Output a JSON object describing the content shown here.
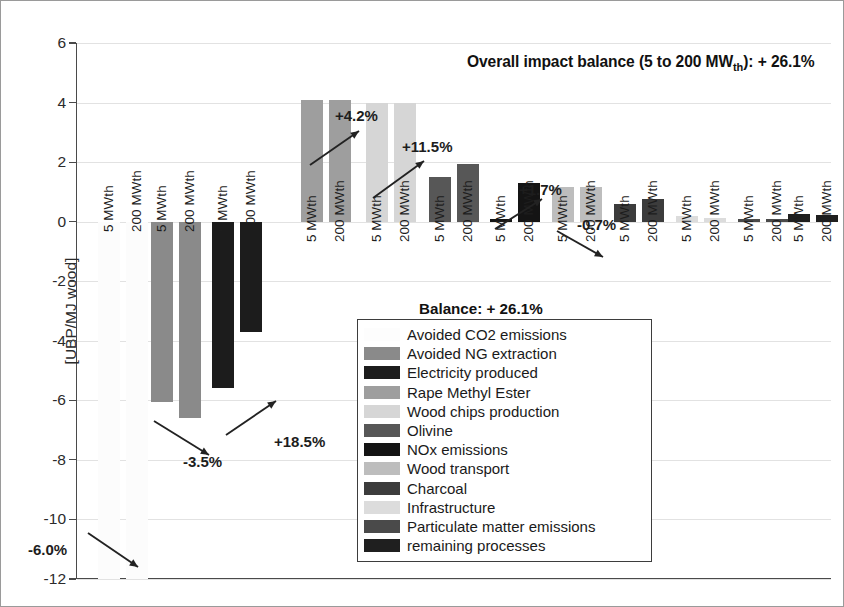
{
  "title": {
    "prefix": "Overall impact balance (5 to 200 MW",
    "sub": "th",
    "suffix": "): + 26.1%",
    "full": "Overall impact balance (5 to 200 MWth): + 26.1%"
  },
  "balance_label": "Balance: + 26.1%",
  "axis": {
    "ylabel": "[UBP/MJ wood]",
    "yticks": [
      "6",
      "4",
      "2",
      "0",
      "-2",
      "-4",
      "-6",
      "-8",
      "-10",
      "-12"
    ],
    "ymin": -12,
    "ymax": 6,
    "step": 2
  },
  "bar_labels": {
    "small": "5 MWth",
    "large": "200 MWth"
  },
  "legend": {
    "items": [
      {
        "label": "Avoided CO2 emissions",
        "color": "#fbfbfb"
      },
      {
        "label": "Avoided NG extraction",
        "color": "#8a8a8a"
      },
      {
        "label": "Electricity produced",
        "color": "#1c1c1c"
      },
      {
        "label": "Rape Methyl Ester",
        "color": "#9e9e9e"
      },
      {
        "label": "Wood chips production",
        "color": "#d6d6d6"
      },
      {
        "label": "Olivine",
        "color": "#575757"
      },
      {
        "label": "NOx emissions",
        "color": "#141414"
      },
      {
        "label": "Wood transport",
        "color": "#bdbdbd"
      },
      {
        "label": "Charcoal",
        "color": "#3c3c3c"
      },
      {
        "label": "Infrastructure",
        "color": "#dcdcdc"
      },
      {
        "label": "Particulate matter emissions",
        "color": "#4a4a4a"
      },
      {
        "label": "remaining processes",
        "color": "#1f1f1f"
      }
    ]
  },
  "chart_data": {
    "type": "bar",
    "title": "Overall impact balance (5 to 200 MWth): + 26.1%",
    "xlabel": "",
    "ylabel": "[UBP/MJ wood]",
    "ylim": [
      -12,
      6
    ],
    "ytick_step": 2,
    "grid": true,
    "legend_position": "inside-bottom-center",
    "series": [
      {
        "name": "5 MWth",
        "values": [
          -12.6,
          -6.05,
          -5.6,
          4.1,
          4.0,
          1.5,
          0.1,
          1.15,
          0.6,
          0.2,
          0.08,
          0.25
        ]
      },
      {
        "name": "200 MWth",
        "values": [
          -13.4,
          -6.6,
          -3.7,
          4.1,
          4.0,
          1.95,
          1.3,
          1.15,
          0.75,
          0.12,
          0.08,
          0.22
        ]
      }
    ],
    "categories": [
      "Avoided CO2 emissions",
      "Avoided NG extraction",
      "Electricity produced",
      "Rape Methyl Ester",
      "Wood chips production",
      "Olivine",
      "NOx emissions",
      "Wood transport",
      "Charcoal",
      "Infrastructure",
      "Particulate matter emissions",
      "remaining processes"
    ],
    "annotations": [
      {
        "text": "-6.0%",
        "direction": "down"
      },
      {
        "text": "-3.5%",
        "direction": "down"
      },
      {
        "text": "+18.5%",
        "direction": "up"
      },
      {
        "text": "+4.2%",
        "direction": "up"
      },
      {
        "text": "+11.5%",
        "direction": "up"
      },
      {
        "text": "+1.7%",
        "direction": "up"
      },
      {
        "text": "-0.7%",
        "direction": "down"
      }
    ]
  },
  "annotation_text": {
    "a0": "-6.0%",
    "a1": "-3.5%",
    "a2": "+18.5%",
    "a3": "+4.2%",
    "a4": "+11.5%",
    "a5": "+1.7%",
    "a6": "-0.7%"
  }
}
